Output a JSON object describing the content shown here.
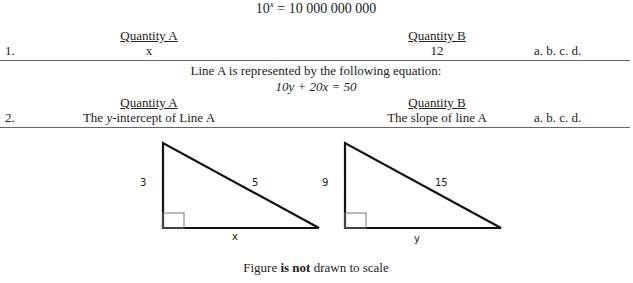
{
  "header_equation": {
    "base": "10",
    "exponent": "x",
    "rhs": "= 10 000 000 000"
  },
  "question1": {
    "number": "1.",
    "quantity_a_heading": "Quantity A",
    "quantity_b_heading": "Quantity B",
    "quantity_a": "x",
    "quantity_b": "12",
    "choices": "a. b. c. d."
  },
  "line_statement": "Line A is represented by the following equation:",
  "line_equation": "10y + 20x = 50",
  "question2": {
    "number": "2.",
    "quantity_a_heading": "Quantity A",
    "quantity_b_heading": "Quantity B",
    "quantity_a_prefix": "The ",
    "quantity_a_var": "y",
    "quantity_a_suffix": "-intercept of Line A",
    "quantity_b": "The slope of line A",
    "choices": "a. b. c. d."
  },
  "figure": {
    "triangle1": {
      "leg_vertical": "3",
      "hypotenuse": "5",
      "leg_horizontal": "x"
    },
    "triangle2": {
      "leg_vertical": "9",
      "hypotenuse": "15",
      "leg_horizontal": "y"
    },
    "caption_prefix": "Figure ",
    "caption_bold": "is not",
    "caption_suffix": " drawn to scale"
  }
}
